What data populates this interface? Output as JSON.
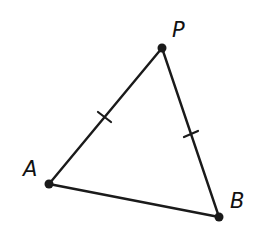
{
  "diagram": {
    "type": "triangle",
    "stroke_color": "#1a1a1a",
    "vertices": [
      {
        "id": "P",
        "label": "P",
        "x": 162,
        "y": 48,
        "label_x": 172,
        "label_y": 37
      },
      {
        "id": "A",
        "label": "A",
        "x": 49,
        "y": 184,
        "label_x": 23,
        "label_y": 176
      },
      {
        "id": "B",
        "label": "B",
        "x": 219,
        "y": 217,
        "label_x": 230,
        "label_y": 208
      }
    ],
    "segments": [
      {
        "from": "A",
        "to": "P",
        "tick_marks": 1
      },
      {
        "from": "P",
        "to": "B",
        "tick_marks": 1
      },
      {
        "from": "A",
        "to": "B",
        "tick_marks": 0
      }
    ],
    "congruence": "AP ≅ BP"
  }
}
